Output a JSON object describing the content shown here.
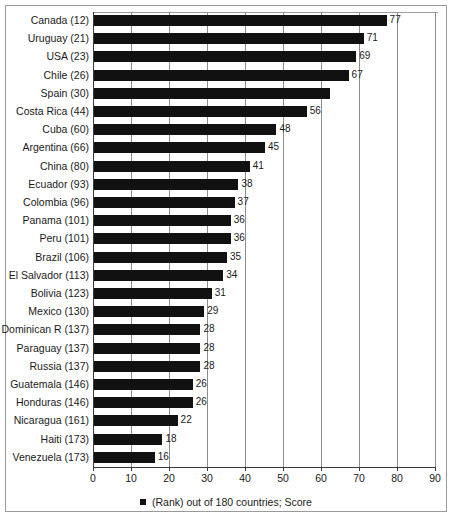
{
  "chart_data": {
    "type": "bar",
    "orientation": "horizontal",
    "title": "",
    "subtitle": "",
    "xlabel": "",
    "ylabel": "",
    "xlim": [
      0,
      90
    ],
    "xticks": [
      0,
      10,
      20,
      30,
      40,
      50,
      60,
      70,
      80,
      90
    ],
    "grid": true,
    "grid_axis": "x",
    "legend_position": "bottom",
    "legend": [
      "(Rank) out of 180 countries; Score"
    ],
    "series_color": "#111111",
    "categories": [
      "Canada (12)",
      "Uruguay (21)",
      "USA (23)",
      "Chile (26)",
      "Spain (30)",
      "Costa Rica (44)",
      "Cuba (60)",
      "Argentina (66)",
      "China (80)",
      "Ecuador (93)",
      "Colombia (96)",
      "Panama (101)",
      "Peru (101)",
      "Brazil (106)",
      "El Salvador (113)",
      "Bolivia (123)",
      "Mexico (130)",
      "Dominican R (137)",
      "Paraguay (137)",
      "Russia (137)",
      "Guatemala (146)",
      "Honduras (146)",
      "Nicaragua (161)",
      "Haiti (173)",
      "Venezuela (173)"
    ],
    "values": [
      77,
      71,
      69,
      67,
      62,
      56,
      48,
      45,
      41,
      38,
      37,
      36,
      36,
      35,
      34,
      31,
      29,
      28,
      28,
      28,
      26,
      26,
      22,
      18,
      16
    ],
    "value_labels": [
      "77",
      "71",
      "69",
      "67",
      "",
      "56",
      "48",
      "45",
      "41",
      "38",
      "37",
      "36",
      "36",
      "35",
      "34",
      "31",
      "29",
      "28",
      "28",
      "28",
      "26",
      "26",
      "22",
      "18",
      "16"
    ],
    "ranks": [
      12,
      21,
      23,
      26,
      30,
      44,
      60,
      66,
      80,
      93,
      96,
      101,
      101,
      106,
      113,
      123,
      130,
      137,
      137,
      137,
      146,
      146,
      161,
      173,
      173
    ],
    "countries": [
      "Canada",
      "Uruguay",
      "USA",
      "Chile",
      "Spain",
      "Costa Rica",
      "Cuba",
      "Argentina",
      "China",
      "Ecuador",
      "Colombia",
      "Panama",
      "Peru",
      "Brazil",
      "El Salvador",
      "Bolivia",
      "Mexico",
      "Dominican R",
      "Paraguay",
      "Russia",
      "Guatemala",
      "Honduras",
      "Nicaragua",
      "Haiti",
      "Venezuela"
    ]
  },
  "legend": {
    "entry_label": "(Rank) out of 180 countries; Score",
    "swatch_color": "#111111"
  },
  "colors": {
    "bar": "#111111",
    "grid": "#8d8d8d",
    "axis": "#3a3a3a",
    "frame": "#9a9a9a",
    "text": "#1a1a1a",
    "background": "#ffffff"
  }
}
